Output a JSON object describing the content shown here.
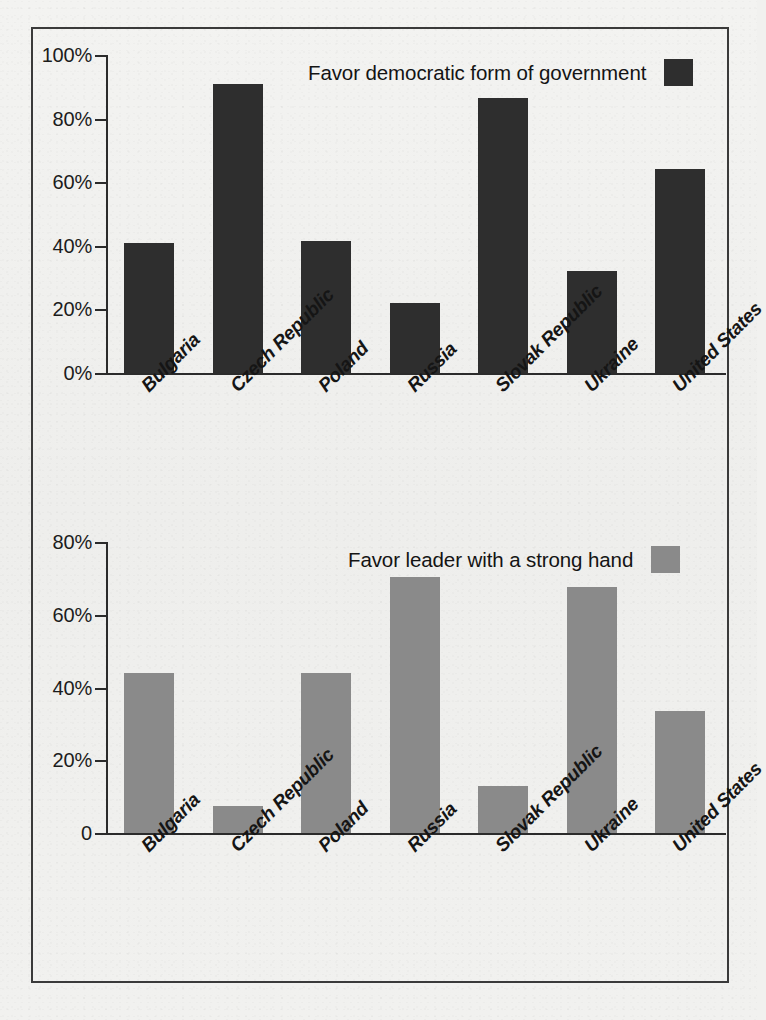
{
  "figure": {
    "background_color": "#f1f1ef",
    "frame_color": "#3a3a3a"
  },
  "chart_data": [
    {
      "type": "bar",
      "title": "Favor democratic form of government",
      "xlabel": "",
      "ylabel": "",
      "ylim": [
        0,
        100
      ],
      "yticks": [
        0,
        20,
        40,
        60,
        80,
        100
      ],
      "ytick_labels": [
        "0%",
        "20%",
        "40%",
        "60%",
        "80%",
        "100%"
      ],
      "grid": false,
      "legend_position": "top-right",
      "series_color": "#2e2e2e",
      "categories": [
        "Bulgaria",
        "Czech Republic",
        "Poland",
        "Russia",
        "Slovak Republic",
        "Ukraine",
        "United States"
      ],
      "values": [
        41,
        91,
        41.5,
        22,
        86.5,
        32,
        64
      ]
    },
    {
      "type": "bar",
      "title": "Favor leader with a strong hand",
      "xlabel": "",
      "ylabel": "",
      "ylim": [
        0,
        80
      ],
      "yticks": [
        0,
        20,
        40,
        60,
        80
      ],
      "ytick_labels": [
        "0",
        "20%",
        "40%",
        "60%",
        "80%"
      ],
      "grid": false,
      "legend_position": "top-right",
      "series_color": "#8a8a8a",
      "categories": [
        "Bulgaria",
        "Czech Republic",
        "Poland",
        "Russia",
        "Slovak Republic",
        "Ukraine",
        "United States"
      ],
      "values": [
        44,
        7.5,
        44,
        70.5,
        13,
        67.5,
        33.5
      ]
    }
  ],
  "top_chart": {
    "legend": {
      "label": "Favor democratic form of government",
      "swatch_color": "#2e2e2e"
    },
    "ytick_labels": [
      "100%",
      "80%",
      "60%",
      "40%",
      "20%",
      "0%"
    ],
    "categories": [
      "Bulgaria",
      "Czech Republic",
      "Poland",
      "Russia",
      "Slovak Republic",
      "Ukraine",
      "United States"
    ]
  },
  "bottom_chart": {
    "legend": {
      "label": "Favor leader with a strong hand",
      "swatch_color": "#8a8a8a"
    },
    "ytick_labels": [
      "80%",
      "60%",
      "40%",
      "20%",
      "0"
    ],
    "categories": [
      "Bulgaria",
      "Czech Republic",
      "Poland",
      "Russia",
      "Slovak Republic",
      "Ukraine",
      "United States"
    ]
  }
}
